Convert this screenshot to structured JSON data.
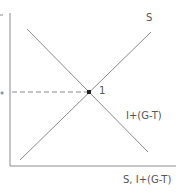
{
  "diagram": {
    "curves": [
      {
        "name": "S",
        "label": "S",
        "from": [
          20,
          160
        ],
        "to": [
          151,
          32
        ]
      },
      {
        "name": "I+(G-T)",
        "label": "I+(G-T)",
        "from": [
          27,
          29
        ],
        "to": [
          148,
          152
        ]
      }
    ],
    "equilibrium": {
      "label": "1",
      "point": [
        89,
        92
      ]
    },
    "y_level_label": "*",
    "x_axis_label": "S, I+(G-T)",
    "line_color": "#8a8a8a",
    "text_color": "#555555"
  }
}
